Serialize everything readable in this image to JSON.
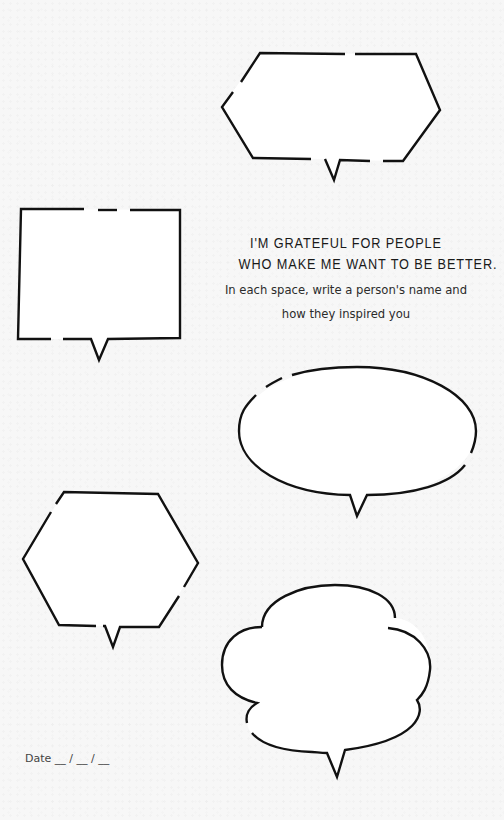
{
  "page": {
    "background_color": "#f7f7f7",
    "ink_color": "#111111"
  },
  "heading": {
    "title_line_1": "I'M GRATEFUL FOR PEOPLE",
    "title_line_2": "WHO MAKE ME WANT TO BE BETTER.",
    "subtitle_line_1": "In each space, write a person's name and",
    "subtitle_line_2": "how they inspired you"
  },
  "date": {
    "label": "Date __ / __ / __"
  },
  "bubbles": [
    {
      "shape": "elongated-hexagon",
      "position": "top-right"
    },
    {
      "shape": "rectangle",
      "position": "upper-left"
    },
    {
      "shape": "oval",
      "position": "middle-right"
    },
    {
      "shape": "hexagon",
      "position": "lower-left"
    },
    {
      "shape": "cloud",
      "position": "bottom-right"
    }
  ]
}
